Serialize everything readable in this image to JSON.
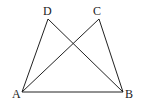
{
  "diagram": {
    "type": "geometry",
    "points": {
      "A": {
        "label": "A",
        "x": 22,
        "y": 92
      },
      "B": {
        "label": "B",
        "x": 123,
        "y": 92
      },
      "C": {
        "label": "C",
        "x": 99,
        "y": 19
      },
      "D": {
        "label": "D",
        "x": 48,
        "y": 19
      }
    },
    "segments": [
      "AB",
      "AD",
      "AC",
      "BD",
      "BC"
    ],
    "labels": {
      "A": "A",
      "B": "B",
      "C": "C",
      "D": "D"
    },
    "colors": {
      "stroke": "#222222",
      "background": "#ffffff"
    }
  }
}
